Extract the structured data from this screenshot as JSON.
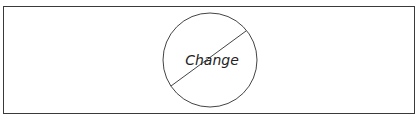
{
  "diagram": {
    "label": "Change",
    "shape": "circle-with-slash",
    "colors": {
      "stroke": "#3a3a3a",
      "background": "#ffffff",
      "text": "#222222"
    }
  }
}
